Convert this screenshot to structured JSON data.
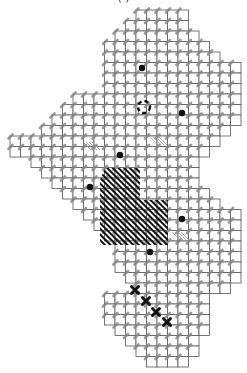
{
  "title": "(                    )",
  "chart_data": {
    "type": "diagram",
    "grid": {
      "origin_x": 10,
      "origin_y": 10,
      "cell": 10.5,
      "cols": 22,
      "rows": 34
    },
    "row_spans": [
      [
        12,
        17
      ],
      [
        11,
        17
      ],
      [
        10,
        18
      ],
      [
        9,
        19
      ],
      [
        9,
        20
      ],
      [
        9,
        22
      ],
      [
        9,
        22
      ],
      [
        9,
        22
      ],
      [
        6,
        22
      ],
      [
        5,
        22
      ],
      [
        4,
        22
      ],
      [
        3,
        21
      ],
      [
        0,
        20
      ],
      [
        0,
        19
      ],
      [
        2,
        18
      ],
      [
        3,
        18
      ],
      [
        4,
        18
      ],
      [
        5,
        19
      ],
      [
        6,
        20
      ],
      [
        7,
        22
      ],
      [
        8,
        22
      ],
      [
        9,
        22
      ],
      [
        10,
        22
      ],
      [
        10,
        22
      ],
      [
        10,
        22
      ],
      [
        11,
        22
      ],
      [
        12,
        21
      ],
      [
        9,
        19
      ],
      [
        9,
        19
      ],
      [
        9,
        19
      ],
      [
        10,
        19
      ],
      [
        11,
        18
      ],
      [
        12,
        18
      ],
      [
        13,
        17
      ]
    ],
    "hatched_region": {
      "polygon": [
        [
          105,
          168
        ],
        [
          140,
          168
        ],
        [
          140,
          200
        ],
        [
          168,
          200
        ],
        [
          168,
          245
        ],
        [
          100,
          245
        ],
        [
          100,
          180
        ]
      ]
    },
    "dots": [
      [
        142,
        68
      ],
      [
        182,
        113
      ],
      [
        120,
        155
      ],
      [
        90,
        187
      ],
      [
        182,
        219
      ],
      [
        150,
        252
      ]
    ],
    "dashed_circle": {
      "cx": 144,
      "cy": 107,
      "r": 6
    },
    "x_marks": [
      [
        135,
        290
      ],
      [
        146,
        301
      ],
      [
        156,
        312
      ],
      [
        167,
        322
      ]
    ],
    "light_hatches": [
      [
        83,
        150
      ],
      [
        150,
        145
      ],
      [
        172,
        240
      ]
    ],
    "colors": {
      "grid": "#555555",
      "stitch": "#888888",
      "hatch": "#111111",
      "marker": "#111111"
    }
  }
}
